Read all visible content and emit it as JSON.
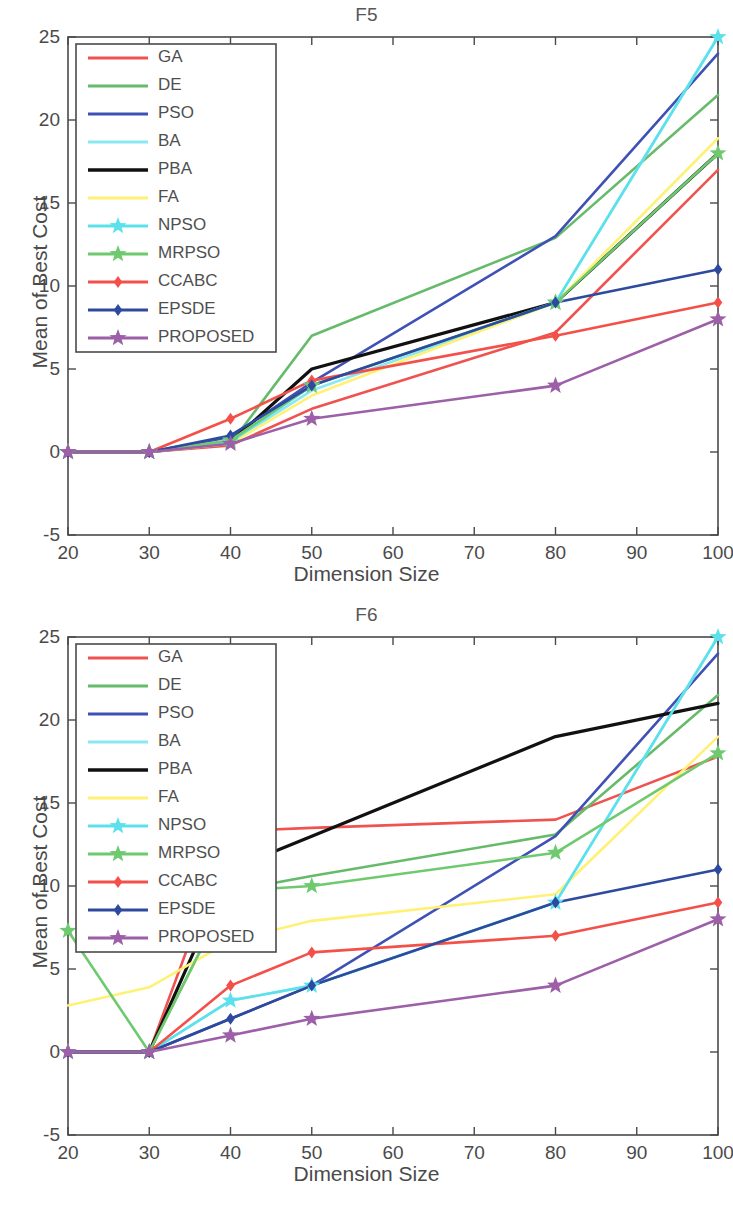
{
  "figures": [
    {
      "id": "f5",
      "title": "F5",
      "xlabel": "Dimension Size",
      "ylabel": "Mean of Best Cost"
    },
    {
      "id": "f6",
      "title": "F6",
      "xlabel": "Dimension Size",
      "ylabel": "Mean of Best Cost"
    }
  ],
  "axis": {
    "x_ticks": [
      "20",
      "30",
      "40",
      "50",
      "60",
      "70",
      "80",
      "90",
      "100"
    ],
    "y_ticks": [
      "25",
      "20",
      "15",
      "10",
      "5",
      "0",
      "-5"
    ]
  },
  "legend": {
    "entries": [
      {
        "label": "GA",
        "color": "#ef5350",
        "marker": "none"
      },
      {
        "label": "DE",
        "color": "#66bb6a",
        "marker": "none"
      },
      {
        "label": "PSO",
        "color": "#3f51b5",
        "marker": "none"
      },
      {
        "label": "BA",
        "color": "#8ae8f2",
        "marker": "none"
      },
      {
        "label": "PBA",
        "color": "#111111",
        "marker": "none"
      },
      {
        "label": "FA",
        "color": "#fff176",
        "marker": "none"
      },
      {
        "label": "NPSO",
        "color": "#5ce1ec",
        "marker": "star"
      },
      {
        "label": "MRPSO",
        "color": "#6fca6f",
        "marker": "star"
      },
      {
        "label": "CCABC",
        "color": "#f4504a",
        "marker": "diamond"
      },
      {
        "label": "EPSDE",
        "color": "#2e4a9e",
        "marker": "diamond"
      },
      {
        "label": "PROPOSED",
        "color": "#9c5fa8",
        "marker": "star"
      }
    ]
  },
  "chart_data": [
    {
      "type": "line",
      "title": "F5",
      "xlabel": "Dimension Size",
      "ylabel": "Mean of Best Cost",
      "xlim": [
        20,
        100
      ],
      "ylim": [
        -5,
        25
      ],
      "xticks": [
        20,
        30,
        40,
        50,
        60,
        70,
        80,
        90,
        100
      ],
      "yticks": [
        -5,
        0,
        5,
        10,
        15,
        20,
        25
      ],
      "grid": false,
      "legend_position": "upper-left",
      "x": [
        20,
        30,
        40,
        50,
        80,
        100
      ],
      "series": [
        {
          "name": "GA",
          "color": "#ef5350",
          "marker": "none",
          "values": [
            0,
            0,
            0.4,
            2.6,
            7.2,
            17.0
          ]
        },
        {
          "name": "DE",
          "color": "#66bb6a",
          "marker": "none",
          "values": [
            0,
            0,
            0.5,
            7.0,
            12.9,
            21.5
          ]
        },
        {
          "name": "PSO",
          "color": "#3f51b5",
          "marker": "none",
          "values": [
            0,
            0,
            0.9,
            4.2,
            13.0,
            24.0
          ]
        },
        {
          "name": "BA",
          "color": "#8ae8f2",
          "marker": "none",
          "values": [
            0,
            0,
            0.6,
            3.7,
            9.0,
            25.0
          ]
        },
        {
          "name": "PBA",
          "color": "#111111",
          "marker": "none",
          "values": [
            0,
            0,
            0.6,
            5.0,
            9.0,
            18.0
          ]
        },
        {
          "name": "FA",
          "color": "#fff176",
          "marker": "none",
          "values": [
            0,
            0,
            0.5,
            3.4,
            9.0,
            18.9
          ]
        },
        {
          "name": "NPSO",
          "color": "#5ce1ec",
          "marker": "star",
          "values": [
            0,
            0,
            0.6,
            4.0,
            9.0,
            25.0
          ]
        },
        {
          "name": "MRPSO",
          "color": "#6fca6f",
          "marker": "star",
          "values": [
            0,
            0,
            0.7,
            4.0,
            9.0,
            18.0
          ]
        },
        {
          "name": "CCABC",
          "color": "#f4504a",
          "marker": "diamond",
          "values": [
            0,
            0,
            2.0,
            4.3,
            7.0,
            9.0
          ]
        },
        {
          "name": "EPSDE",
          "color": "#2e4a9e",
          "marker": "diamond",
          "values": [
            0,
            0,
            1.0,
            4.0,
            9.0,
            11.0
          ]
        },
        {
          "name": "PROPOSED",
          "color": "#9c5fa8",
          "marker": "star",
          "values": [
            0,
            0,
            0.5,
            2.0,
            4.0,
            8.0
          ]
        }
      ]
    },
    {
      "type": "line",
      "title": "F6",
      "xlabel": "Dimension Size",
      "ylabel": "Mean of Best Cost",
      "xlim": [
        20,
        100
      ],
      "ylim": [
        -5,
        25
      ],
      "xticks": [
        20,
        30,
        40,
        50,
        60,
        70,
        80,
        90,
        100
      ],
      "yticks": [
        -5,
        0,
        5,
        10,
        15,
        20,
        25
      ],
      "grid": false,
      "legend_position": "upper-left",
      "x": [
        20,
        30,
        40,
        50,
        80,
        100
      ],
      "series": [
        {
          "name": "GA",
          "color": "#ef5350",
          "marker": "none",
          "values": [
            0,
            0,
            13.3,
            13.5,
            14.0,
            17.8
          ]
        },
        {
          "name": "DE",
          "color": "#66bb6a",
          "marker": "none",
          "values": [
            0,
            0,
            9.7,
            10.6,
            13.1,
            21.5
          ]
        },
        {
          "name": "PSO",
          "color": "#3f51b5",
          "marker": "none",
          "values": [
            0,
            0,
            2.0,
            4.0,
            13.0,
            24.0
          ]
        },
        {
          "name": "BA",
          "color": "#8ae8f2",
          "marker": "none",
          "values": [
            0,
            0,
            3.1,
            4.0,
            9.0,
            25.0
          ]
        },
        {
          "name": "PBA",
          "color": "#111111",
          "marker": "none",
          "values": [
            0,
            0,
            11.0,
            13.0,
            19.0,
            21.0
          ]
        },
        {
          "name": "FA",
          "color": "#fff176",
          "marker": "none",
          "values": [
            2.8,
            3.9,
            6.7,
            7.9,
            9.5,
            19.0
          ]
        },
        {
          "name": "NPSO",
          "color": "#5ce1ec",
          "marker": "star",
          "values": [
            0,
            0,
            3.1,
            4.0,
            9.0,
            25.0
          ]
        },
        {
          "name": "MRPSO",
          "color": "#6fca6f",
          "marker": "star",
          "values": [
            7.3,
            0,
            9.7,
            10.0,
            12.0,
            18.0
          ]
        },
        {
          "name": "CCABC",
          "color": "#f4504a",
          "marker": "diamond",
          "values": [
            0,
            0,
            4.0,
            6.0,
            7.0,
            9.0
          ]
        },
        {
          "name": "EPSDE",
          "color": "#2e4a9e",
          "marker": "diamond",
          "values": [
            0,
            0,
            2.0,
            4.0,
            9.0,
            11.0
          ]
        },
        {
          "name": "PROPOSED",
          "color": "#9c5fa8",
          "marker": "star",
          "values": [
            0,
            0,
            1.0,
            2.0,
            4.0,
            8.0
          ]
        }
      ]
    }
  ]
}
